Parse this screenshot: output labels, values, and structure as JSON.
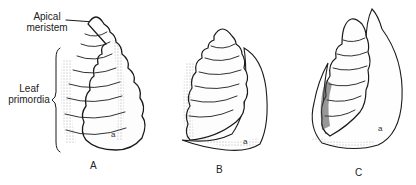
{
  "figure": {
    "annotations": {
      "apical_meristem": {
        "line1": "Apical",
        "line2": "meristem"
      },
      "leaf_primordia": {
        "line1": "Leaf",
        "line2": "primordia"
      }
    },
    "panels": [
      {
        "label": "A",
        "leaf_marker": "a"
      },
      {
        "label": "B",
        "leaf_marker": "a"
      },
      {
        "label": "C",
        "leaf_marker": "a"
      }
    ],
    "colors": {
      "ink": "#1a1a1a",
      "background": "#ffffff"
    }
  }
}
